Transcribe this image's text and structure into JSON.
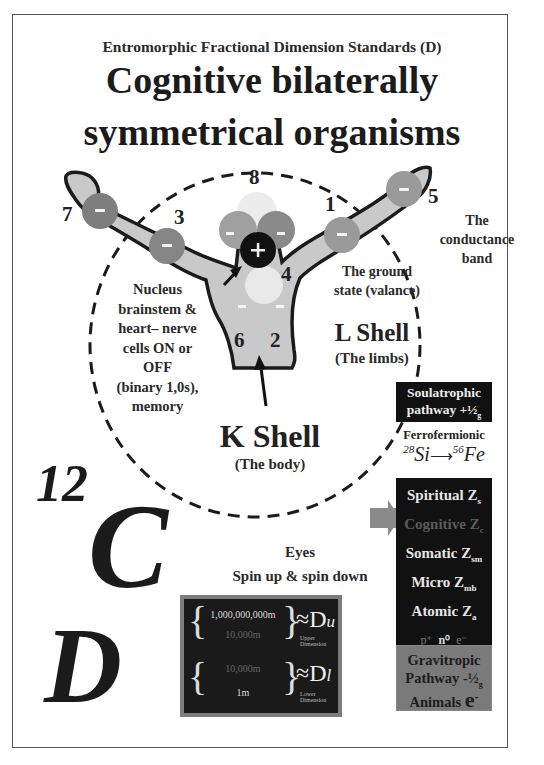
{
  "header": {
    "subtitle": "Entromorphic Fractional Dimension Standards (D)",
    "title_line1": "Cognitive bilaterally",
    "title_line2": "symmetrical organisms"
  },
  "diagram": {
    "electron_numbers": [
      "8",
      "7",
      "3",
      "1",
      "5",
      "4",
      "6",
      "2"
    ],
    "nucleus_symbol": "+",
    "electron_symbol": "-",
    "labels": {
      "conductance_band": [
        "The",
        "conductance",
        "band"
      ],
      "ground_state": [
        "The ground",
        "state (valance)"
      ],
      "nucleus_note": [
        "Nucleus",
        "brainstem &",
        "heart– nerve",
        "cells ON or",
        "OFF",
        "(binary 1,0s),",
        "memory"
      ],
      "l_shell": "L Shell",
      "l_shell_sub": "(The limbs)",
      "k_shell": "K Shell",
      "k_shell_sub": "(The body)",
      "eyes": "Eyes",
      "spin": "Spin up & spin down"
    },
    "colors": {
      "body_fill": "#c9c9c9",
      "electron_dark": "#7e7e7e",
      "electron_mid": "#989898",
      "electron_light": "#e2e2e2",
      "nucleus": "#111111"
    }
  },
  "carbon": {
    "mass_number": "12",
    "symbol": "C"
  },
  "dimension_symbol": "D",
  "dimension_box": {
    "upper_top": "1,000,000,000m",
    "upper_bottom": "10,000m",
    "upper_symbol": "≈D",
    "upper_sub": "u",
    "upper_caption": "Upper Dimension",
    "lower_top": "10,000m",
    "lower_bottom": "1m",
    "lower_symbol": "≈D",
    "lower_sub": "l",
    "lower_caption": "Lower Dimension"
  },
  "sidebar": {
    "soul_line1": "Soulatrophic",
    "soul_line2": "pathway +½",
    "soul_sub": "g",
    "ferro_label": "Ferrofermionic",
    "ferro_si_mass": "28",
    "ferro_si": "Si",
    "ferro_fe_mass": "56",
    "ferro_fe": "Fe",
    "z_levels": [
      {
        "label": "Spiritual Z",
        "sub": "s",
        "dim": false
      },
      {
        "label": "Cognitive Z",
        "sub": "c",
        "dim": true
      },
      {
        "label": "Somatic Z",
        "sub": "sm",
        "dim": false
      },
      {
        "label": "Micro Z",
        "sub": "mb",
        "dim": false
      },
      {
        "label": "Atomic  Z",
        "sub": "a",
        "dim": false
      }
    ],
    "particles": [
      "p⁺",
      "n⁰",
      "e⁻"
    ],
    "grav_line1": "Gravitropic",
    "grav_line2": "Pathway -½",
    "grav_sub": "g",
    "grav_line3": "Animals",
    "grav_e": "e",
    "grav_e_sup": "-"
  }
}
